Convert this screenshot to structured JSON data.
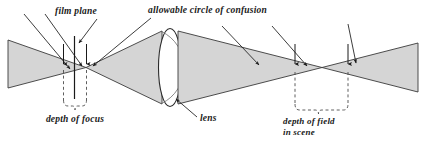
{
  "figure": {
    "background_color": "#ffffff",
    "cone_fill_color": "#d5d5d5",
    "cone_stroke_color": "#3a3a3a",
    "lens_fill_color": "#ffffff",
    "lens_stroke_color": "#2b2b2b",
    "line_color": "#1a1a1a",
    "dash_color": "#4d4d4d"
  },
  "labels": {
    "film_plane": "film plane",
    "allowable_circle_of_confusion": "allowable circle of confusion",
    "depth_of_focus": "depth of focus",
    "lens": "lens",
    "depth_of_field_line1": "depth of field",
    "depth_of_field_line2": "in scene"
  },
  "elements": {
    "film_plane_line": "vertical-solid-line",
    "left_focus_marker_left": "dashed-vertical-line-with-down-arrow",
    "left_focus_marker_right": "dashed-vertical-line-with-down-arrow",
    "right_field_marker_left": "dashed-vertical-line-with-down-arrow",
    "right_field_marker_right": "dashed-vertical-line-with-down-arrow",
    "depth_of_focus_brace": "dashed-curly-brace-down",
    "depth_of_field_brace": "dashed-curly-brace-down",
    "image_side_cone": "converging-light-cone-left",
    "object_side_cone": "converging-light-cone-right",
    "lens_shape": "biconvex-lens-ellipse"
  }
}
